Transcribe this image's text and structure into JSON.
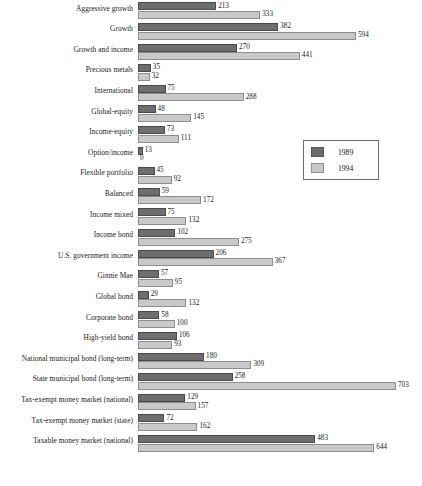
{
  "chart_data": {
    "type": "bar",
    "orientation": "horizontal",
    "grouped": true,
    "title": "",
    "subtitle": "",
    "xlabel": "",
    "ylabel": "",
    "grid": false,
    "xlim": [
      0,
      703
    ],
    "legend_position": "middle-right",
    "categories": [
      "Aggressive growth",
      "Growth",
      "Growth and income",
      "Precious metals",
      "International",
      "Global-equity",
      "Income-equity",
      "Option/income",
      "Flexible portfolio",
      "Balanced",
      "Income mixed",
      "Income bond",
      "U.S. government income",
      "Ginnie Mae",
      "Global bond",
      "Corporate bond",
      "High-yield bond",
      "National municipal bond (long-term)",
      "State municipal bond (long-term)",
      "Tax-exempt money market (national)",
      "Tax-exempt money market (state)",
      "Taxable money market (national)"
    ],
    "series": [
      {
        "name": "1989",
        "color": "#6e6e6e",
        "values": [
          213,
          382,
          270,
          35,
          75,
          48,
          73,
          13,
          45,
          59,
          75,
          102,
          206,
          57,
          29,
          58,
          106,
          180,
          258,
          129,
          72,
          483
        ]
      },
      {
        "name": "1994",
        "color": "#c9c9c9",
        "values": [
          333,
          594,
          441,
          32,
          288,
          145,
          111,
          0,
          92,
          172,
          132,
          275,
          367,
          95,
          132,
          100,
          93,
          309,
          703,
          157,
          162,
          644
        ]
      }
    ]
  },
  "legend": {
    "entries": [
      {
        "label": "1989"
      },
      {
        "label": "1994"
      }
    ]
  },
  "layout": {
    "plot_left_px": 138,
    "plot_width_px": 258,
    "row_height_px": 20.6,
    "bar_height_px": 8
  }
}
